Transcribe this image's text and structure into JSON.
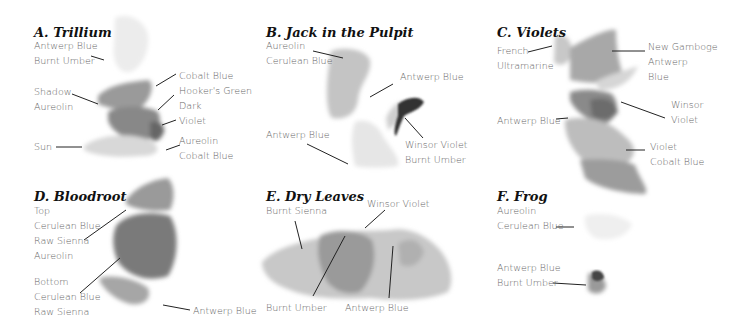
{
  "panels": [
    {
      "id": "A",
      "title": "A. Trillium",
      "labels": [
        {
          "lines": [
            "Antwerp Blue",
            "Burnt Umber"
          ]
        },
        {
          "lines": [
            "Shadow",
            "Aureolin"
          ]
        },
        {
          "lines": [
            "Sun"
          ]
        },
        {
          "lines": [
            "Cobalt Blue"
          ]
        },
        {
          "lines": [
            "Hooker's Green"
          ]
        },
        {
          "lines": [
            "Dark",
            "Violet"
          ]
        },
        {
          "lines": [
            "Aureolin",
            "Cobalt Blue"
          ]
        }
      ]
    },
    {
      "id": "B",
      "title": "B. Jack in the Pulpit",
      "labels": [
        {
          "lines": [
            "Aureolin",
            "Cerulean Blue"
          ]
        },
        {
          "lines": [
            "Antwerp Blue"
          ]
        },
        {
          "lines": [
            "Antwerp Blue"
          ]
        },
        {
          "lines": [
            "Winsor Violet",
            "Burnt Umber"
          ]
        }
      ]
    },
    {
      "id": "C",
      "title": "C. Violets",
      "labels": [
        {
          "lines": [
            "French",
            "Ultramarine"
          ]
        },
        {
          "lines": [
            "New Gamboge",
            "Antwerp",
            "Blue"
          ]
        },
        {
          "lines": [
            "Winsor",
            "Violet"
          ]
        },
        {
          "lines": [
            "Antwerp Blue"
          ]
        },
        {
          "lines": [
            "Violet",
            "Cobalt Blue"
          ]
        }
      ]
    },
    {
      "id": "D",
      "title": "D. Bloodroot",
      "labels": [
        {
          "lines": [
            "Top",
            "Cerulean Blue",
            "Raw Sienna",
            "Aureolin"
          ]
        },
        {
          "lines": [
            "Bottom",
            "Cerulean Blue",
            "Raw Sienna"
          ]
        },
        {
          "lines": [
            "Antwerp Blue"
          ]
        }
      ]
    },
    {
      "id": "E",
      "title": "E. Dry Leaves",
      "labels": [
        {
          "lines": [
            "Burnt Sienna"
          ]
        },
        {
          "lines": [
            "Winsor Violet"
          ]
        },
        {
          "lines": [
            "Burnt Umber"
          ]
        },
        {
          "lines": [
            "Antwerp Blue"
          ]
        }
      ]
    },
    {
      "id": "F",
      "title": "F. Frog",
      "labels": [
        {
          "lines": [
            "Aureolin",
            "Cerulean Blue"
          ]
        },
        {
          "lines": [
            "Antwerp Blue",
            "Burnt Umber"
          ]
        }
      ]
    }
  ],
  "colors": {
    "title": "#111111",
    "label": "#666666",
    "leader": "#222222"
  }
}
